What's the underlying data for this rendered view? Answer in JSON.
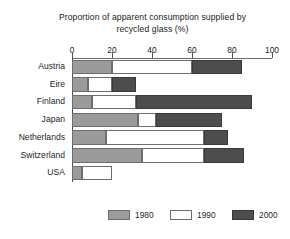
{
  "chart_data": {
    "type": "bar",
    "orientation": "horizontal",
    "stacked": false,
    "grouped_as_stacked_segments": true,
    "title": "Proportion of apparent consumption supplied by recycled glass (%)",
    "title_line1": "Proportion of apparent consumption supplied by",
    "title_line2": "recycled glass (%)",
    "xlabel": "",
    "ylabel": "",
    "xlim": [
      0,
      100
    ],
    "xticks": [
      0,
      20,
      40,
      60,
      80,
      100
    ],
    "xtick_labels": [
      "0",
      "20",
      "40",
      "60",
      "80",
      "100"
    ],
    "grid": false,
    "legend_position": "bottom",
    "categories": [
      "Austria",
      "Eire",
      "Finland",
      "Japan",
      "Netherlands",
      "Switzerland",
      "USA"
    ],
    "series": [
      {
        "name": "1980",
        "color": "#9b9b9b",
        "values": [
          20,
          8,
          10,
          33,
          17,
          35,
          5
        ]
      },
      {
        "name": "1990",
        "color": "#ffffff",
        "values": [
          60,
          20,
          32,
          42,
          66,
          66,
          20
        ]
      },
      {
        "name": "2000",
        "color": "#4d4d4d",
        "values": [
          85,
          32,
          90,
          75,
          78,
          86,
          0
        ]
      }
    ],
    "bars": [
      {
        "category": "Austria",
        "segments": [
          {
            "series": "1980",
            "start": 0,
            "end": 20
          },
          {
            "series": "1990",
            "start": 20,
            "end": 60
          },
          {
            "series": "2000",
            "start": 60,
            "end": 85
          }
        ]
      },
      {
        "category": "Eire",
        "segments": [
          {
            "series": "1980",
            "start": 0,
            "end": 8
          },
          {
            "series": "1990",
            "start": 8,
            "end": 20
          },
          {
            "series": "2000",
            "start": 20,
            "end": 32
          }
        ]
      },
      {
        "category": "Finland",
        "segments": [
          {
            "series": "1980",
            "start": 0,
            "end": 10
          },
          {
            "series": "1990",
            "start": 10,
            "end": 32
          },
          {
            "series": "2000",
            "start": 32,
            "end": 90
          }
        ]
      },
      {
        "category": "Japan",
        "segments": [
          {
            "series": "1980",
            "start": 0,
            "end": 33
          },
          {
            "series": "1990",
            "start": 33,
            "end": 42
          },
          {
            "series": "2000",
            "start": 42,
            "end": 75
          }
        ]
      },
      {
        "category": "Netherlands",
        "segments": [
          {
            "series": "1980",
            "start": 0,
            "end": 17
          },
          {
            "series": "1990",
            "start": 17,
            "end": 66
          },
          {
            "series": "2000",
            "start": 66,
            "end": 78
          }
        ]
      },
      {
        "category": "Switzerland",
        "segments": [
          {
            "series": "1980",
            "start": 0,
            "end": 35
          },
          {
            "series": "1990",
            "start": 35,
            "end": 66
          },
          {
            "series": "2000",
            "start": 66,
            "end": 86
          }
        ]
      },
      {
        "category": "USA",
        "segments": [
          {
            "series": "1980",
            "start": 0,
            "end": 5
          },
          {
            "series": "1990",
            "start": 5,
            "end": 20
          }
        ]
      }
    ],
    "legend": [
      {
        "label": "1980",
        "color": "#9b9b9b"
      },
      {
        "label": "1990",
        "color": "#ffffff"
      },
      {
        "label": "2000",
        "color": "#4d4d4d"
      }
    ]
  }
}
